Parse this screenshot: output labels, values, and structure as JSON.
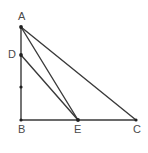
{
  "figure": {
    "kind": "geometry-diagram",
    "background_color": "#ffffff",
    "stroke_color": "#3a3a3a",
    "label_color": "#4a4a4a",
    "labels": {
      "a": "A",
      "b": "B",
      "c": "C",
      "d": "D",
      "e": "E"
    },
    "points": [
      {
        "name": "A",
        "x": 21,
        "y": 27,
        "label": "A",
        "label_x": 18,
        "label_y": 11
      },
      {
        "name": "D",
        "x": 21,
        "y": 55,
        "label": "D",
        "label_x": 8,
        "label_y": 49
      },
      {
        "name": "B",
        "x": 21,
        "y": 120,
        "label": "B",
        "label_x": 18,
        "label_y": 124
      },
      {
        "name": "E",
        "x": 78,
        "y": 120,
        "label": "E",
        "label_x": 74,
        "label_y": 124
      },
      {
        "name": "C",
        "x": 136,
        "y": 120,
        "label": "C",
        "label_x": 133,
        "label_y": 124
      }
    ],
    "tick_point": {
      "name": "midpoint-mark",
      "x": 21,
      "y": 87
    },
    "segments": [
      {
        "name": "AB",
        "from": "A",
        "to": "B"
      },
      {
        "name": "BC",
        "from": "B",
        "to": "C"
      },
      {
        "name": "AC",
        "from": "A",
        "to": "C"
      },
      {
        "name": "AE",
        "from": "A",
        "to": "E"
      },
      {
        "name": "DE",
        "from": "D",
        "to": "E"
      }
    ]
  }
}
